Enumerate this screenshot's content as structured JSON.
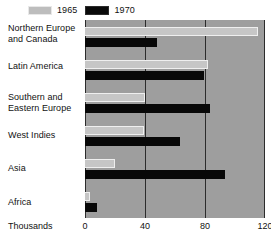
{
  "chart_data": {
    "type": "bar",
    "orientation": "horizontal",
    "title": "",
    "xlabel": "Thousands",
    "ylabel": "",
    "xlim": [
      0,
      120
    ],
    "xticks": [
      0,
      40,
      80,
      120
    ],
    "grid": true,
    "legend_position": "top-left",
    "categories": [
      "Northern Europe and Canada",
      "Latin America",
      "Southern and Eastern Europe",
      "West Indies",
      "Asia",
      "Africa"
    ],
    "series": [
      {
        "name": "1965",
        "color": "#c6c6c6",
        "values": [
          115,
          82,
          40,
          39,
          20,
          3
        ]
      },
      {
        "name": "1970",
        "color": "#080808",
        "values": [
          48,
          79,
          83,
          63,
          93,
          8
        ]
      }
    ]
  },
  "legend": {
    "entries": [
      {
        "label": "1965",
        "swatch": "legend-swatch-1965"
      },
      {
        "label": "1970",
        "swatch": "legend-swatch-1970"
      }
    ]
  },
  "category_labels": [
    {
      "line1": "Northern Europe",
      "line2": "and Canada"
    },
    {
      "line1": "Latin America",
      "line2": ""
    },
    {
      "line1": "Southern and",
      "line2": "Eastern Europe"
    },
    {
      "line1": "West Indies",
      "line2": ""
    },
    {
      "line1": "Asia",
      "line2": ""
    },
    {
      "line1": "Africa",
      "line2": ""
    }
  ],
  "axis": {
    "title": "Thousands",
    "ticks": [
      "0",
      "40",
      "80",
      "120"
    ]
  },
  "colors": {
    "plot_background": "#9e9e9e",
    "gridline": "#2c2c2c",
    "series_1965": "#c6c6c6",
    "series_1970": "#080808",
    "text": "#111111",
    "page_background": "#ffffff"
  }
}
